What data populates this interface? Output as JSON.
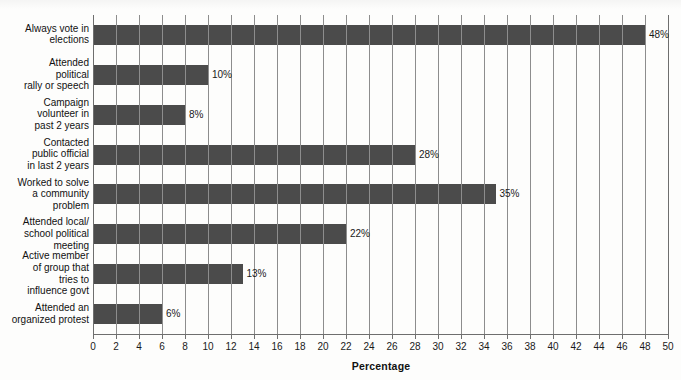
{
  "chart_data": {
    "type": "bar",
    "orientation": "horizontal",
    "title": "",
    "xlabel": "Percentage",
    "ylabel": "",
    "xlim": [
      0,
      50
    ],
    "xtick_step": 2,
    "grid": true,
    "legend": false,
    "bar_color": "#4b4b4b",
    "categories": [
      "Always vote in elections",
      "Attended political rally or speech",
      "Campaign volunteer in past 2 years",
      "Contacted public official in last 2 years",
      "Worked to solve a community problem",
      "Attended local/ school political meeting",
      "Active member of group that tries to influence govt",
      "Attended an organized protest"
    ],
    "values": [
      48,
      10,
      8,
      28,
      35,
      22,
      13,
      6
    ],
    "value_labels": [
      "48%",
      "10%",
      "8%",
      "28%",
      "35%",
      "22%",
      "13%",
      "6%"
    ],
    "xticks": [
      0,
      2,
      4,
      6,
      8,
      10,
      12,
      14,
      16,
      18,
      20,
      22,
      24,
      26,
      28,
      30,
      32,
      34,
      36,
      38,
      40,
      42,
      44,
      46,
      48,
      50
    ],
    "xtick_labels": [
      "0",
      "2",
      "4",
      "6",
      "8",
      "10",
      "12",
      "14",
      "16",
      "18",
      "20",
      "22",
      "24",
      "26",
      "28",
      "30",
      "32",
      "34",
      "36",
      "38",
      "40",
      "42",
      "44",
      "46",
      "48",
      "50"
    ]
  },
  "category_label_lines": [
    [
      "Always vote in",
      "elections"
    ],
    [
      "Attended",
      "political",
      "rally or speech"
    ],
    [
      "Campaign",
      "volunteer in",
      "past 2 years"
    ],
    [
      "Contacted",
      "public official",
      "in last 2 years"
    ],
    [
      "Worked to solve",
      "a community",
      "problem"
    ],
    [
      "Attended local/",
      "school political",
      "meeting"
    ],
    [
      "Active member",
      "of group that",
      "tries to",
      "influence govt"
    ],
    [
      "Attended an",
      "organized protest"
    ]
  ]
}
